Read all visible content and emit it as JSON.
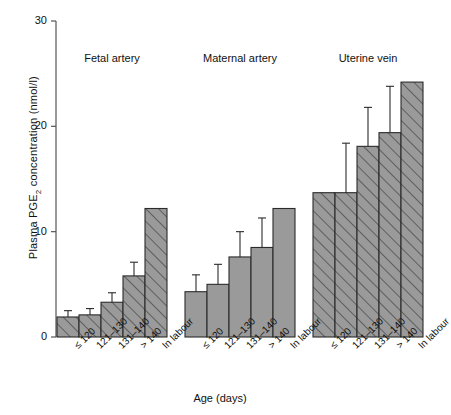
{
  "chart_data": {
    "type": "bar",
    "title": "",
    "xlabel": "Age (days)",
    "ylabel": "Plasma PGE2 concentration (nmol/l)",
    "ylabel_parts": {
      "pre": "Plasma PGE",
      "sub": "2",
      "post": " concentration (nmol/l)"
    },
    "ylim": [
      0,
      30
    ],
    "yticks": [
      0,
      10,
      20,
      30
    ],
    "ytick_labels": [
      "0",
      "10",
      "20",
      "30"
    ],
    "grid": false,
    "legend": "none",
    "error_bars": "upper standard error only; no error bar on 'In labour' category",
    "categories": [
      "≤ 120",
      "121–130",
      "131–140",
      "> 140",
      "In labour"
    ],
    "groups": [
      {
        "name": "Fetal artery",
        "fill": "hatched",
        "values": [
          1.9,
          2.1,
          3.3,
          5.8,
          12.2
        ],
        "errors": [
          0.6,
          0.6,
          0.9,
          1.3,
          0.0
        ]
      },
      {
        "name": "Maternal artery",
        "fill": "solid",
        "values": [
          4.3,
          5.0,
          7.6,
          8.5,
          12.2
        ],
        "errors": [
          1.6,
          1.9,
          2.4,
          2.8,
          0.0
        ]
      },
      {
        "name": "Uterine vein",
        "fill": "hatched",
        "values": [
          13.7,
          13.7,
          18.1,
          19.4,
          24.2
        ],
        "errors": [
          0.0,
          4.7,
          3.7,
          4.4,
          0.0
        ]
      }
    ],
    "colors": {
      "bar_fill": "#9a9a9a",
      "bar_edge": "#2b2b2b",
      "hatch": "#5e5e5e",
      "axis": "#555555",
      "text": "#111111",
      "background": "#ffffff"
    }
  }
}
